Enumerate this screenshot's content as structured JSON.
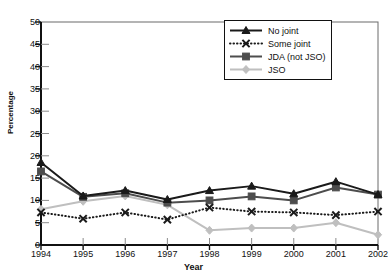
{
  "chart_data": {
    "type": "line",
    "title": "",
    "xlabel": "Year",
    "ylabel": "Percentage",
    "categories": [
      "1994",
      "1995",
      "1996",
      "1997",
      "1998",
      "1999",
      "2000",
      "2001",
      "2002"
    ],
    "x": [
      1994,
      1995,
      1996,
      1997,
      1998,
      1999,
      2000,
      2001,
      2002
    ],
    "ylim": [
      0,
      50
    ],
    "yticks": [
      0,
      5,
      10,
      15,
      20,
      25,
      30,
      35,
      40,
      45,
      50
    ],
    "grid": false,
    "legend_position": "top-right",
    "series": [
      {
        "name": "No joint",
        "color": "#1a1a1a",
        "marker": "triangle",
        "linestyle": "solid",
        "values": [
          18.5,
          11.0,
          12.2,
          10.2,
          12.2,
          13.2,
          11.5,
          14.2,
          11.3
        ]
      },
      {
        "name": "Some joint",
        "color": "#1a1a1a",
        "marker": "x",
        "linestyle": "dotted",
        "values": [
          7.3,
          5.9,
          7.3,
          5.7,
          8.4,
          7.5,
          7.3,
          6.7,
          7.5
        ]
      },
      {
        "name": "JDA (not JSO)",
        "color": "#4d4d4d",
        "marker": "square",
        "linestyle": "solid",
        "values": [
          16.5,
          10.8,
          11.6,
          9.5,
          10.0,
          10.9,
          10.0,
          12.9,
          11.3
        ]
      },
      {
        "name": "JSO",
        "color": "#bfbfbf",
        "marker": "diamond",
        "linestyle": "solid",
        "values": [
          8.0,
          9.8,
          11.0,
          9.0,
          3.3,
          3.8,
          3.8,
          5.0,
          2.3
        ]
      }
    ]
  },
  "axis": {
    "ylabel": "Percentage",
    "xlabel": "Year",
    "yticks": [
      "0",
      "5",
      "10",
      "15",
      "20",
      "25",
      "30",
      "35",
      "40",
      "45",
      "50"
    ],
    "xticks": [
      "1994",
      "1995",
      "1996",
      "1997",
      "1998",
      "1999",
      "2000",
      "2001",
      "2002"
    ]
  },
  "legend": {
    "items": [
      {
        "label": "No joint",
        "marker": "triangle-marker",
        "color": "#1a1a1a",
        "linestyle": "solid"
      },
      {
        "label": "Some joint",
        "marker": "x-marker",
        "color": "#1a1a1a",
        "linestyle": "dotted"
      },
      {
        "label": "JDA (not JSO)",
        "marker": "square-marker",
        "color": "#4d4d4d",
        "linestyle": "solid"
      },
      {
        "label": "JSO",
        "marker": "diamond-marker",
        "color": "#bfbfbf",
        "linestyle": "solid"
      }
    ]
  }
}
